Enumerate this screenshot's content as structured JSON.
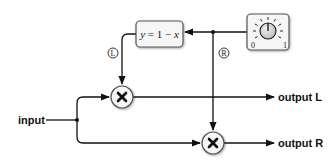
{
  "diagram": {
    "title": "",
    "nodes": {
      "input": {
        "label": "input"
      },
      "output_l": {
        "label": "output L"
      },
      "output_r": {
        "label": "output R"
      },
      "inverter": {
        "label_y": "y",
        "label_eq": " = 1 − ",
        "label_x": "x"
      },
      "knob": {
        "min_label": "0",
        "max_label": "1"
      },
      "multiplier_l": {
        "symbol": "×"
      },
      "multiplier_r": {
        "symbol": "×"
      }
    },
    "channel_labels": {
      "left": "L",
      "right": "R"
    },
    "edges": [
      {
        "from": "knob",
        "to": "inverter"
      },
      {
        "from": "knob",
        "to": "multiplier_r",
        "label": "R"
      },
      {
        "from": "inverter",
        "to": "multiplier_l",
        "label": "L"
      },
      {
        "from": "input",
        "to": "multiplier_l"
      },
      {
        "from": "input",
        "to": "multiplier_r"
      },
      {
        "from": "multiplier_l",
        "to": "output_l"
      },
      {
        "from": "multiplier_r",
        "to": "output_r"
      }
    ],
    "colors": {
      "line": "#111111",
      "node_fill": "#f4f4f4",
      "node_border": "#555555",
      "knob_fill": "#d9d9d9"
    }
  }
}
